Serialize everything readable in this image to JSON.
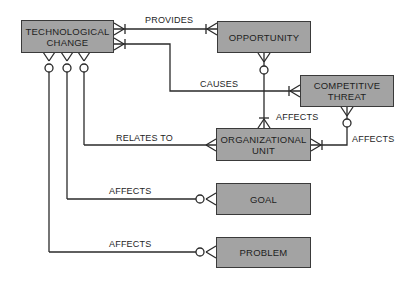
{
  "diagram": {
    "type": "entity-relationship",
    "entities": [
      {
        "id": "tech",
        "label": "TECHNOLOGICAL CHANGE",
        "line1": "TECHNOLOGICAL",
        "line2": "CHANGE"
      },
      {
        "id": "opp",
        "label": "OPPORTUNITY"
      },
      {
        "id": "threat",
        "label": "COMPETITIVE THREAT",
        "line1": "COMPETITIVE",
        "line2": "THREAT"
      },
      {
        "id": "org",
        "label": "ORGANIZATIONAL UNIT",
        "line1": "ORGANIZATIONAL",
        "line2": "UNIT"
      },
      {
        "id": "goal",
        "label": "GOAL"
      },
      {
        "id": "problem",
        "label": "PROBLEM"
      }
    ],
    "relationships": [
      {
        "from": "OPPORTUNITY",
        "to": "TECHNOLOGICAL CHANGE",
        "label": "PROVIDES"
      },
      {
        "from": "COMPETITIVE THREAT",
        "to": "TECHNOLOGICAL CHANGE",
        "label": "CAUSES"
      },
      {
        "from": "TECHNOLOGICAL CHANGE",
        "to": "ORGANIZATIONAL UNIT",
        "label": "RELATES TO"
      },
      {
        "from": "OPPORTUNITY",
        "to": "ORGANIZATIONAL UNIT",
        "label": "AFFECTS"
      },
      {
        "from": "COMPETITIVE THREAT",
        "to": "ORGANIZATIONAL UNIT",
        "label": "AFFECTS"
      },
      {
        "from": "TECHNOLOGICAL CHANGE",
        "to": "GOAL",
        "label": "AFFECTS"
      },
      {
        "from": "TECHNOLOGICAL CHANGE",
        "to": "PROBLEM",
        "label": "AFFECTS"
      }
    ],
    "labels": {
      "provides": "PROVIDES",
      "causes": "CAUSES",
      "relates_to": "RELATES TO",
      "affects_opp_org": "AFFECTS",
      "affects_threat_org": "AFFECTS",
      "affects_goal": "AFFECTS",
      "affects_problem": "AFFECTS"
    },
    "colors": {
      "entity_fill": "#a3a3a3",
      "line": "#2a2a2a",
      "background": "#ffffff"
    }
  }
}
